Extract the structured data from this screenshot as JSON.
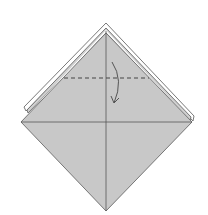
{
  "diagram": {
    "caption": "Valley fold the top point down along the dashed line",
    "colors": {
      "background": "#ffffff",
      "paper": "#c8c8c8",
      "paper_edge": "#6a6a6a",
      "layer_white": "#ffffff",
      "crease": "#555555",
      "dash": "#444444",
      "arrow": "#555555"
    },
    "shapes": {
      "diamond": {
        "top": [
          106,
          27
        ],
        "left": [
          21,
          122
        ],
        "right": [
          192,
          122
        ],
        "bottom": [
          106,
          211
        ]
      },
      "back_layers": [
        {
          "name": "outer-layer",
          "top": [
            106,
            24
          ],
          "left": [
            24,
            109
          ],
          "right": [
            193,
            118
          ]
        },
        {
          "name": "middle-layer",
          "top": [
            106,
            30
          ],
          "left": [
            27,
            112
          ],
          "right": [
            190,
            115
          ]
        }
      ],
      "horizontal_crease": {
        "y": 122,
        "x1": 21,
        "x2": 192
      },
      "vertical_crease": {
        "x": 106,
        "y1": 30,
        "y2": 211
      },
      "valley_fold_line": {
        "y": 78,
        "x1": 64,
        "x2": 149,
        "style": "dashed"
      },
      "fold_arrow": {
        "start": [
          112,
          62
        ],
        "end": [
          114,
          103
        ],
        "direction": "down"
      }
    }
  }
}
